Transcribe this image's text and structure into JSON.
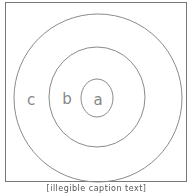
{
  "diagram": {
    "type": "concentric-circles",
    "stroke_color": "#8a8a8a",
    "circles": [
      {
        "name": "outer",
        "label": "c",
        "cx": 98,
        "cy": 98,
        "rx": 84,
        "ry": 84
      },
      {
        "name": "middle",
        "label": "b",
        "cx": 97,
        "cy": 97,
        "rx": 48,
        "ry": 50
      },
      {
        "name": "inner",
        "label": "a",
        "cx": 97,
        "cy": 98,
        "rx": 16,
        "ry": 19
      }
    ],
    "labels": {
      "a": "a",
      "b": "b",
      "c": "c"
    }
  },
  "caption": "[illegible caption text]"
}
